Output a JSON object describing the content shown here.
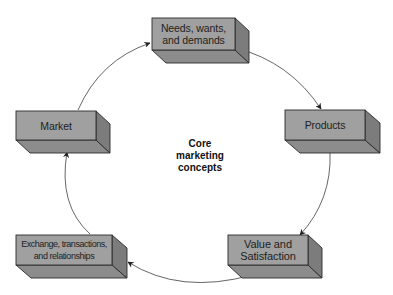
{
  "diagram": {
    "title": "Core marketing concepts",
    "center_label_lines": [
      "Core",
      "marketing",
      "concepts"
    ],
    "colors": {
      "front_face": "#a0a0a0",
      "bottom_face": "#8c8c8c",
      "side_face": "#7c7c7c",
      "edge": "#2a2a2a",
      "connector": "#555555"
    },
    "nodes": [
      {
        "id": "needs",
        "label": "Needs, wants, and demands",
        "lines": [
          "Needs, wants,",
          "and demands"
        ]
      },
      {
        "id": "products",
        "label": "Products",
        "lines": [
          "Products"
        ]
      },
      {
        "id": "value",
        "label": "Value and Satisfaction",
        "lines": [
          "Value and",
          "Satisfaction"
        ]
      },
      {
        "id": "exchange",
        "label": "Exchange, transactions, and relationships",
        "lines": [
          "Exchange, transactions,",
          "and relationships"
        ]
      },
      {
        "id": "market",
        "label": "Market",
        "lines": [
          "Market"
        ]
      }
    ],
    "edges": [
      {
        "from": "needs",
        "to": "products"
      },
      {
        "from": "products",
        "to": "value"
      },
      {
        "from": "value",
        "to": "exchange"
      },
      {
        "from": "exchange",
        "to": "market"
      },
      {
        "from": "market",
        "to": "needs"
      }
    ]
  }
}
